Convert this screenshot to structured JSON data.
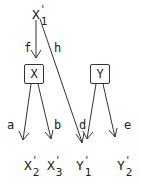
{
  "diagram": {
    "root": {
      "letter": "X",
      "prime": "'",
      "sub": "1"
    },
    "boxes": [
      {
        "id": "X",
        "label": "X"
      },
      {
        "id": "Y",
        "label": "Y"
      }
    ],
    "edge_labels": {
      "f": "f",
      "h": "h",
      "a": "a",
      "b": "b",
      "d": "d",
      "e": "e"
    },
    "leaves": [
      {
        "letter": "X",
        "prime": "'",
        "sub": "2"
      },
      {
        "letter": "X",
        "prime": "'",
        "sub": "3"
      },
      {
        "letter": "Y",
        "prime": "'",
        "sub": "1"
      },
      {
        "letter": "Y",
        "prime": "'",
        "sub": "2"
      }
    ],
    "edges": [
      {
        "from": "X'1",
        "to": "X",
        "label": "f"
      },
      {
        "from": "X'1",
        "to": "Y'1",
        "label": "h"
      },
      {
        "from": "X",
        "to": "X'2",
        "label": "a"
      },
      {
        "from": "X",
        "to": "X'3",
        "label": "b"
      },
      {
        "from": "Y",
        "to": "Y'1",
        "label": "d"
      },
      {
        "from": "Y",
        "to": "Y'2",
        "label": "e"
      }
    ]
  }
}
